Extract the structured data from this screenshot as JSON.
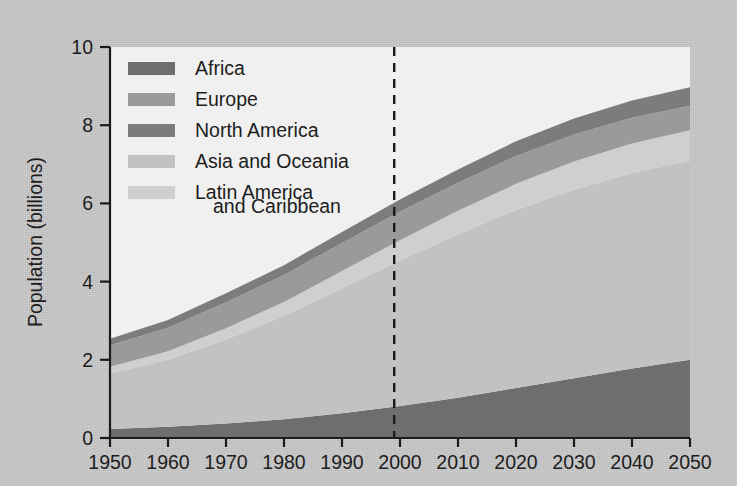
{
  "figure": {
    "background_color": "#c8c8c8",
    "plot_background_color": "#f0f0f0"
  },
  "axes": {
    "y_title": "Population (billions)",
    "y_ticks": [
      "0",
      "2",
      "4",
      "6",
      "8",
      "10"
    ],
    "y_tick_values": [
      0,
      2,
      4,
      6,
      8,
      10
    ],
    "x_ticks": [
      "1950",
      "1960",
      "1970",
      "1980",
      "1990",
      "2000",
      "2010",
      "2020",
      "2030",
      "2040",
      "2050"
    ],
    "x_tick_values": [
      1950,
      1960,
      1970,
      1980,
      1990,
      2000,
      2010,
      2020,
      2030,
      2040,
      2050
    ],
    "x_title": ""
  },
  "annotations": {
    "projection_divider_year": 1999,
    "projection_divider_style": "dashed"
  },
  "legend": {
    "position": "top-left-inside",
    "items": [
      {
        "label": "Africa",
        "color": "#6e6e6e"
      },
      {
        "label": "Europe",
        "color": "#9a9a9a"
      },
      {
        "label": "North America",
        "color": "#7c7c7c"
      },
      {
        "label": "Asia and Oceania",
        "color": "#c2c2c2"
      },
      {
        "label": "Latin America",
        "label_line2": "and Caribbean",
        "color": "#cfcfcf"
      }
    ]
  },
  "chart_data": {
    "type": "area",
    "stacked": true,
    "title": "",
    "xlabel": "",
    "ylabel": "Population (billions)",
    "xlim": [
      1950,
      2050
    ],
    "ylim": [
      0,
      10
    ],
    "grid": false,
    "legend_position": "top-left-inside",
    "x": [
      1950,
      1960,
      1970,
      1980,
      1990,
      2000,
      2010,
      2020,
      2030,
      2040,
      2050
    ],
    "stack_order_bottom_to_top": [
      "Africa",
      "Asia and Oceania",
      "Latin America and Caribbean",
      "Europe",
      "North America"
    ],
    "series": [
      {
        "name": "Africa",
        "color": "#6e6e6e",
        "values": [
          0.23,
          0.29,
          0.37,
          0.48,
          0.63,
          0.82,
          1.03,
          1.28,
          1.53,
          1.78,
          2.0
        ]
      },
      {
        "name": "Asia and Oceania",
        "color": "#c2c2c2",
        "values": [
          1.42,
          1.71,
          2.15,
          2.64,
          3.2,
          3.72,
          4.18,
          4.55,
          4.82,
          5.0,
          5.1
        ]
      },
      {
        "name": "Latin America and Caribbean",
        "color": "#cfcfcf",
        "values": [
          0.17,
          0.22,
          0.29,
          0.36,
          0.44,
          0.52,
          0.6,
          0.67,
          0.72,
          0.75,
          0.77
        ]
      },
      {
        "name": "Europe",
        "color": "#9a9a9a",
        "values": [
          0.55,
          0.6,
          0.66,
          0.69,
          0.72,
          0.73,
          0.72,
          0.71,
          0.69,
          0.66,
          0.63
        ]
      },
      {
        "name": "North America",
        "color": "#7c7c7c",
        "values": [
          0.17,
          0.2,
          0.23,
          0.25,
          0.28,
          0.31,
          0.34,
          0.38,
          0.41,
          0.44,
          0.47
        ]
      }
    ],
    "totals": [
      2.54,
      3.02,
      3.7,
      4.42,
      5.27,
      6.1,
      6.87,
      7.59,
      8.17,
      8.63,
      8.97
    ]
  }
}
